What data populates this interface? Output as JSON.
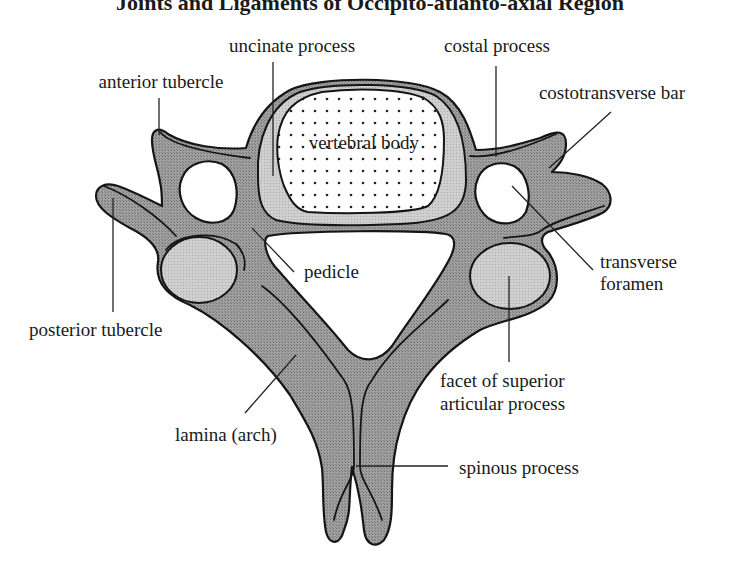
{
  "title": "Joints and Ligaments of Occipito-atlanto-axial Region",
  "diagram": {
    "colors": {
      "bone": "#8c8c8c",
      "bone_light": "#c4c4c4",
      "outline": "#151515",
      "background": "#ffffff"
    },
    "labels": {
      "uncinate_process": "uncinate process",
      "costal_process": "costal process",
      "anterior_tubercle": "anterior tubercle",
      "costotransverse_bar": "costotransverse bar",
      "vertebral_body": "vertebral body",
      "pedicle": "pedicle",
      "transverse_foramen_line1": "transverse",
      "transverse_foramen_line2": "foramen",
      "posterior_tubercle": "posterior tubercle",
      "facet_line1": "facet of superior",
      "facet_line2": "articular process",
      "lamina": "lamina (arch)",
      "spinous_process": "spinous process"
    }
  }
}
